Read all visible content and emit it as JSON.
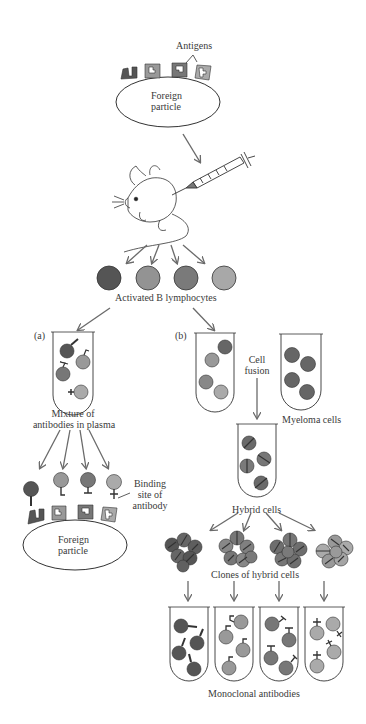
{
  "labels": {
    "antigens": "Antigens",
    "foreign_particle_top_1": "Foreign",
    "foreign_particle_top_2": "particle",
    "activated_b": "Activated B lymphocytes",
    "panel_a": "(a)",
    "panel_b": "(b)",
    "mixture_1": "Mixture of",
    "mixture_2": "antibodies in plasma",
    "binding_1": "Binding",
    "binding_2": "site of",
    "binding_3": "antibody",
    "foreign_particle_bottom_1": "Foreign",
    "foreign_particle_bottom_2": "particle",
    "cell_fusion_1": "Cell",
    "cell_fusion_2": "fusion",
    "myeloma": "Myeloma cells",
    "hybrid": "Hybrid cells",
    "clones": "Clones of hybrid cells",
    "monoclonal": "Monoclonal antibodies"
  },
  "colors": {
    "dark_gray": "#555555",
    "mid_gray": "#8a8a8a",
    "med_dark_gray": "#6e6e6e",
    "light_gray": "#a5a5a5",
    "outline": "#333333",
    "arrow": "#6a6a6a"
  },
  "lymphocytes": [
    {
      "shade": "#555555"
    },
    {
      "shade": "#939393"
    },
    {
      "shade": "#7a7a7a"
    },
    {
      "shade": "#a8a8a8"
    }
  ]
}
